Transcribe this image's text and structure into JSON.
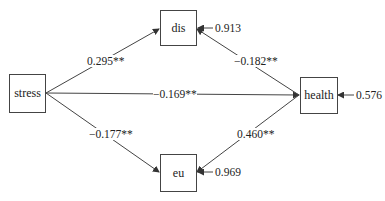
{
  "diagram": {
    "type": "path-model",
    "nodes": {
      "stress": "stress",
      "dis": "dis",
      "health": "health",
      "eu": "eu"
    },
    "paths": {
      "stress_dis": "0.295**",
      "stress_health": "−0.169**",
      "stress_eu": "−0.177**",
      "health_dis": "−0.182**",
      "health_eu": "0.460**"
    },
    "errors": {
      "dis": "0.913",
      "health": "0.576",
      "eu": "0.969"
    }
  }
}
